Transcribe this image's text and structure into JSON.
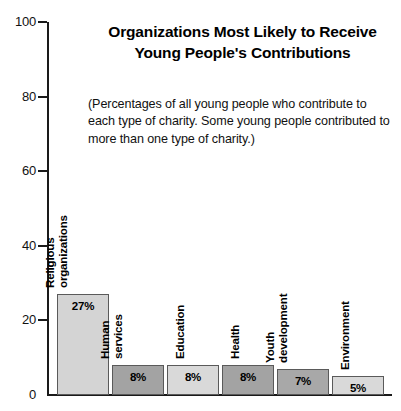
{
  "chart_data": {
    "type": "bar",
    "title": "Organizations Most Likely to Receive Young People's Contributions",
    "title_line1": "Organizations Most Likely to Receive",
    "title_line2": "Young People's Contributions",
    "subtitle": "(Percentages of all young people who contribute to each type of charity. Some young people contributed to more than one type of charity.)",
    "xlabel": "",
    "ylabel": "",
    "ylim": [
      0,
      100
    ],
    "yticks": [
      0,
      20,
      40,
      60,
      80,
      100
    ],
    "ytick_labels": [
      "0",
      "20",
      "40",
      "60",
      "80",
      "100"
    ],
    "grid": false,
    "legend": "none",
    "categories": [
      "Religious organizations",
      "Human services",
      "Education",
      "Health",
      "Youth development",
      "Environment"
    ],
    "values": [
      27,
      8,
      8,
      8,
      7,
      5
    ],
    "value_labels": [
      "27%",
      "8%",
      "8%",
      "8%",
      "7%",
      "5%"
    ],
    "bar_colors": [
      "#d4d4d4",
      "#a3a3a3",
      "#d9d9d9",
      "#a3a3a3",
      "#a8a8a8",
      "#d9d9d9"
    ],
    "bar_edge_color": "#5a5a5a",
    "axis_color": "#1a1a1a",
    "background": "#ffffff"
  },
  "bars": [
    {
      "category": "Religious organizations",
      "label_lines": [
        "Religious",
        "organizations"
      ],
      "value": 27,
      "value_label": "27%",
      "color": "#d4d4d4"
    },
    {
      "category": "Human services",
      "label_lines": [
        "Human",
        "services"
      ],
      "value": 8,
      "value_label": "8%",
      "color": "#a3a3a3"
    },
    {
      "category": "Education",
      "label_lines": [
        "Education"
      ],
      "value": 8,
      "value_label": "8%",
      "color": "#d9d9d9"
    },
    {
      "category": "Health",
      "label_lines": [
        "Health"
      ],
      "value": 8,
      "value_label": "8%",
      "color": "#a3a3a3"
    },
    {
      "category": "Youth development",
      "label_lines": [
        "Youth",
        "development"
      ],
      "value": 7,
      "value_label": "7%",
      "color": "#a8a8a8"
    },
    {
      "category": "Environment",
      "label_lines": [
        "Environment"
      ],
      "value": 5,
      "value_label": "5%",
      "color": "#d9d9d9"
    }
  ]
}
